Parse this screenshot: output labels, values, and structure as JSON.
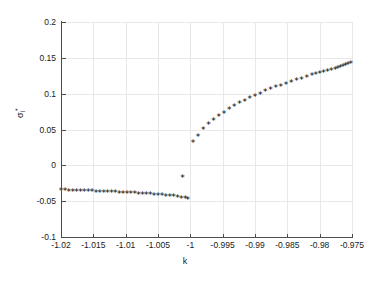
{
  "figure": {
    "background": "#ffffff",
    "axis_color": "#4d4d4d",
    "grid_color": "#e8e8e8",
    "marker_color": "#000000",
    "marker_glyph": "*"
  },
  "chart_data": {
    "type": "scatter",
    "title": "",
    "xlabel": "k",
    "ylabel": "σᵢ*",
    "xlim": [
      -1.02,
      -0.975
    ],
    "ylim": [
      -0.1,
      0.2
    ],
    "xticks": [
      -1.02,
      -1.015,
      -1.01,
      -1.005,
      -1,
      -0.995,
      -0.99,
      -0.985,
      -0.98,
      -0.975
    ],
    "xticklabels": [
      "-1.02",
      "-1.015",
      "-1.01",
      "-1.005",
      "-1",
      "-0.995",
      "-0.99",
      "-0.985",
      "-0.98",
      "-0.975"
    ],
    "yticks": [
      -0.1,
      -0.05,
      0,
      0.05,
      0.1,
      0.15,
      0.2
    ],
    "yticklabels": [
      "-0.1",
      "-0.05",
      "0",
      "0.05",
      "0.1",
      "0.15",
      "0.2"
    ],
    "grid": true,
    "legend": null,
    "series": [
      {
        "name": "lower-branch",
        "marker": "*",
        "points": [
          [
            -1.02,
            -0.037
          ],
          [
            -1.0194,
            -0.0372
          ],
          [
            -1.0188,
            -0.0374
          ],
          [
            -1.0182,
            -0.0376
          ],
          [
            -1.0176,
            -0.0378
          ],
          [
            -1.017,
            -0.038
          ],
          [
            -1.0164,
            -0.0382
          ],
          [
            -1.0158,
            -0.0384
          ],
          [
            -1.0152,
            -0.0386
          ],
          [
            -1.0146,
            -0.0388
          ],
          [
            -1.014,
            -0.039
          ],
          [
            -1.0134,
            -0.0392
          ],
          [
            -1.0128,
            -0.0395
          ],
          [
            -1.0122,
            -0.0397
          ],
          [
            -1.0116,
            -0.0399
          ],
          [
            -1.011,
            -0.0402
          ],
          [
            -1.0104,
            -0.0404
          ],
          [
            -1.0098,
            -0.0407
          ],
          [
            -1.0092,
            -0.041
          ],
          [
            -1.0086,
            -0.0413
          ],
          [
            -1.008,
            -0.0416
          ],
          [
            -1.0074,
            -0.0419
          ],
          [
            -1.0068,
            -0.0422
          ],
          [
            -1.0062,
            -0.0426
          ],
          [
            -1.0056,
            -0.043
          ],
          [
            -1.005,
            -0.0434
          ],
          [
            -1.0044,
            -0.0438
          ],
          [
            -1.0038,
            -0.0443
          ],
          [
            -1.0032,
            -0.0448
          ],
          [
            -1.0026,
            -0.0454
          ],
          [
            -1.002,
            -0.0461
          ],
          [
            -1.0014,
            -0.047
          ],
          [
            -1.0008,
            -0.0482
          ],
          [
            -1.0004,
            -0.0494
          ]
        ]
      },
      {
        "name": "transition-point",
        "marker": "*",
        "points": [
          [
            -1.0012,
            -0.018
          ]
        ]
      },
      {
        "name": "upper-branch",
        "marker": "*",
        "points": [
          [
            -0.9996,
            0.03
          ],
          [
            -0.9988,
            0.0395
          ],
          [
            -0.998,
            0.048
          ],
          [
            -0.9972,
            0.055
          ],
          [
            -0.9964,
            0.061
          ],
          [
            -0.9956,
            0.0665
          ],
          [
            -0.9948,
            0.0715
          ],
          [
            -0.994,
            0.076
          ],
          [
            -0.9932,
            0.0802
          ],
          [
            -0.9924,
            0.0842
          ],
          [
            -0.9916,
            0.088
          ],
          [
            -0.9908,
            0.0915
          ],
          [
            -0.99,
            0.0948
          ],
          [
            -0.9892,
            0.098
          ],
          [
            -0.9884,
            0.101
          ],
          [
            -0.9876,
            0.1039
          ],
          [
            -0.9868,
            0.1066
          ],
          [
            -0.986,
            0.1093
          ],
          [
            -0.9852,
            0.1118
          ],
          [
            -0.9844,
            0.1143
          ],
          [
            -0.9836,
            0.1166
          ],
          [
            -0.9828,
            0.1189
          ],
          [
            -0.982,
            0.1212
          ],
          [
            -0.9812,
            0.1233
          ],
          [
            -0.9806,
            0.125
          ],
          [
            -0.98,
            0.1266
          ],
          [
            -0.9794,
            0.1282
          ],
          [
            -0.9788,
            0.1298
          ],
          [
            -0.9782,
            0.1313
          ],
          [
            -0.9776,
            0.1328
          ],
          [
            -0.9772,
            0.134
          ],
          [
            -0.9768,
            0.1352
          ],
          [
            -0.9764,
            0.1365
          ],
          [
            -0.976,
            0.1378
          ],
          [
            -0.9756,
            0.1392
          ],
          [
            -0.9752,
            0.1406
          ],
          [
            -0.9749,
            0.142
          ],
          [
            -0.9746,
            0.1435
          ],
          [
            -0.9743,
            0.145
          ],
          [
            -0.9741,
            0.1462
          ],
          [
            -0.9739,
            0.1475
          ],
          [
            -0.9737,
            0.149
          ],
          [
            -0.9736,
            0.1505
          ],
          [
            -0.9735,
            0.152
          ],
          [
            -0.9734,
            0.153
          ]
        ]
      }
    ]
  }
}
